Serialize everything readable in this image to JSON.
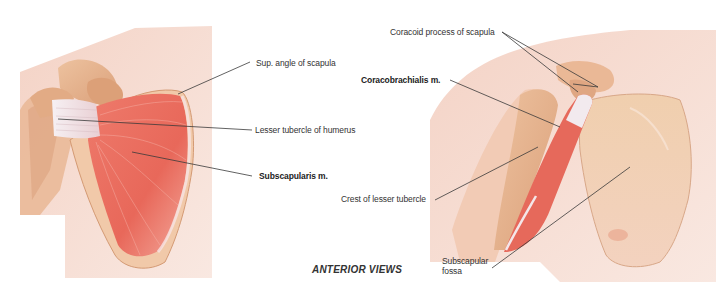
{
  "figure": {
    "caption": "ANTERIOR VIEWS",
    "left_view": {
      "labels": [
        {
          "id": "sup-angle",
          "text": "Sup. angle of scapula",
          "bold": false
        },
        {
          "id": "lesser-tubercle",
          "text": "Lesser tubercle of humerus",
          "bold": false
        },
        {
          "id": "subscapularis",
          "text": "Subscapularis m.",
          "bold": true
        }
      ]
    },
    "right_view": {
      "labels": [
        {
          "id": "coracoid",
          "text": "Coracoid process of scapula",
          "bold": false
        },
        {
          "id": "coracobrachialis",
          "text": "Coracobrachialis m.",
          "bold": true
        },
        {
          "id": "crest",
          "text": "Crest of lesser tubercle",
          "bold": false
        },
        {
          "id": "fossa-line1",
          "text": "Subscapular",
          "bold": false
        },
        {
          "id": "fossa-line2",
          "text": "fossa",
          "bold": false
        }
      ]
    },
    "colors": {
      "skin": "#f6ddd4",
      "skin_shadow": "#eec7b8",
      "bone": "#e8b58f",
      "bone_dark": "#c98b63",
      "muscle": "#e8685a",
      "muscle_light": "#f19a8c",
      "tendon": "#f2ecef",
      "leader_line": "#3a3a3a",
      "text": "#333333"
    }
  }
}
